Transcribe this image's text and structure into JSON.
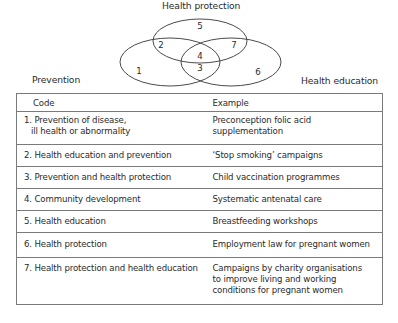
{
  "venn": {
    "sets": [
      {
        "label": "Health protection"
      },
      {
        "label": "Prevention"
      },
      {
        "label": "Health education"
      }
    ],
    "regions": [
      {
        "code": "1",
        "label": "Prevention only"
      },
      {
        "code": "2",
        "label": "Prevention ∩ Health protection"
      },
      {
        "code": "3",
        "label": "Prevention ∩ Health education"
      },
      {
        "code": "4",
        "label": "All three"
      },
      {
        "code": "5",
        "label": "Health protection only"
      },
      {
        "code": "6",
        "label": "Health education only"
      },
      {
        "code": "7",
        "label": "Health protection ∩ Health education"
      }
    ],
    "stroke_color": "#4a4a4a"
  },
  "table": {
    "headers": {
      "code": "Code",
      "example": "Example"
    },
    "rows": [
      {
        "code_line1": "1. Prevention of disease,",
        "code_line2": "ill health or abnormality",
        "example_line1": "Preconception folic acid",
        "example_line2": "supplementation"
      },
      {
        "code": "2. Health education and prevention",
        "example": "‘Stop smoking’ campaigns"
      },
      {
        "code": "3. Prevention and health protection",
        "example": "Child vaccination programmes"
      },
      {
        "code": "4. Community development",
        "example": "Systematic antenatal care"
      },
      {
        "code": "5. Health education",
        "example": "Breastfeeding workshops"
      },
      {
        "code": "6. Health protection",
        "example": "Employment law for pregnant women"
      },
      {
        "code": "7. Health protection and health education",
        "example_line1": "Campaigns by charity organisations",
        "example_line2": "to improve living and working",
        "example_line3": "conditions for pregnant women"
      }
    ]
  }
}
